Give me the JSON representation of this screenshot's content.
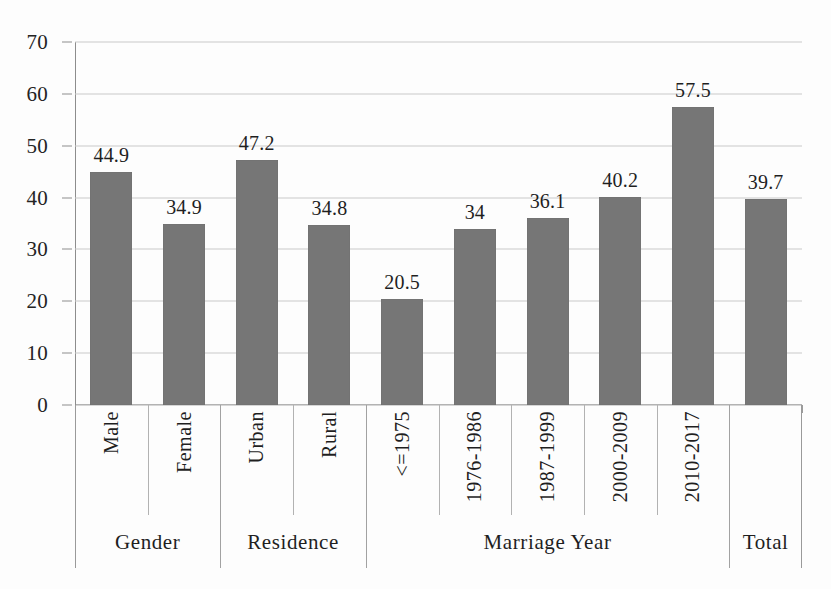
{
  "chart_data": {
    "type": "bar",
    "title": "",
    "xlabel": "",
    "ylabel": "",
    "ylim": [
      0,
      70
    ],
    "ytick_step": 10,
    "yticks": [
      0,
      10,
      20,
      30,
      40,
      50,
      60,
      70
    ],
    "grid": true,
    "legend": "none",
    "bar_color": "#767676",
    "categories": [
      "Male",
      "Female",
      "Urban",
      "Rural",
      "<=1975",
      "1976-1986",
      "1987-1999",
      "2000-2009",
      "2010-2017",
      ""
    ],
    "values": [
      44.9,
      34.9,
      47.2,
      34.8,
      20.5,
      34,
      36.1,
      40.2,
      57.5,
      39.7
    ],
    "value_labels": [
      "44.9",
      "34.9",
      "47.2",
      "34.8",
      "20.5",
      "34",
      "36.1",
      "40.2",
      "57.5",
      "39.7"
    ],
    "groups": [
      {
        "label": "Gender",
        "span": 2
      },
      {
        "label": "Residence",
        "span": 2
      },
      {
        "label": "Marriage Year",
        "span": 5
      },
      {
        "label": "Total",
        "span": 1
      }
    ]
  }
}
